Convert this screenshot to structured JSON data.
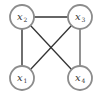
{
  "diagram": {
    "type": "undirected-graph",
    "nodes": [
      {
        "id": "x1",
        "label": "x",
        "subscript": "1",
        "cx": 22,
        "cy": 78
      },
      {
        "id": "x2",
        "label": "x",
        "subscript": "2",
        "cx": 22,
        "cy": 17
      },
      {
        "id": "x3",
        "label": "x",
        "subscript": "3",
        "cx": 80,
        "cy": 17
      },
      {
        "id": "x4",
        "label": "x",
        "subscript": "4",
        "cx": 80,
        "cy": 78
      }
    ],
    "edges": [
      {
        "from": "x2",
        "to": "x3"
      },
      {
        "from": "x2",
        "to": "x1"
      },
      {
        "from": "x3",
        "to": "x4"
      },
      {
        "from": "x2",
        "to": "x4"
      },
      {
        "from": "x3",
        "to": "x1"
      }
    ],
    "colors": {
      "node_stroke": "#8c8c8c",
      "node_fill": "#ffffff",
      "edge": "#333333",
      "edge_light": "#777777"
    }
  }
}
